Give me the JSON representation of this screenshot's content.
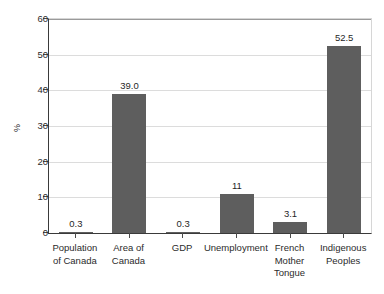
{
  "chart_data": {
    "type": "bar",
    "title": "",
    "subtitle": "",
    "xlabel": "",
    "ylabel": "%",
    "ylim": [
      0,
      60
    ],
    "yticks": [
      0,
      10,
      20,
      30,
      40,
      50,
      60
    ],
    "ytick_labels": [
      "0",
      "10",
      "20",
      "30",
      "40",
      "50",
      "60"
    ],
    "grid": true,
    "legend": false,
    "bar_color": "#5e5e5e",
    "categories": [
      "Population of Canada",
      "Area of Canada",
      "GDP",
      "Unemployment",
      "French Mother Tongue",
      "Indigenous Peoples"
    ],
    "category_lines": [
      [
        "Population",
        "of Canada"
      ],
      [
        "Area of",
        "Canada"
      ],
      [
        "GDP"
      ],
      [
        "Unemployment"
      ],
      [
        "French",
        "Mother",
        "Tongue"
      ],
      [
        "Indigenous",
        "Peoples"
      ]
    ],
    "values": [
      0.3,
      39.0,
      0.3,
      11,
      3.1,
      52.5
    ],
    "value_labels": [
      "0.3",
      "39.0",
      "0.3",
      "11",
      "3.1",
      "52.5"
    ]
  }
}
